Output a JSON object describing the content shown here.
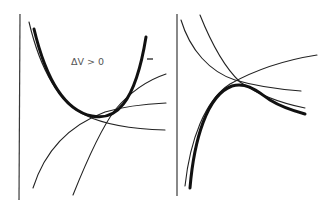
{
  "figure": {
    "panels": [
      {
        "id": "left",
        "label": "ΔV > 0",
        "marker": "–",
        "description": "Thick U-shaped envelope curve tangent to thin curves"
      },
      {
        "id": "right",
        "description": "Thick humped curve with thin intersecting curves"
      }
    ]
  }
}
